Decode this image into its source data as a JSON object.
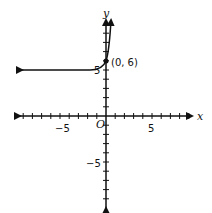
{
  "graph": {
    "x_axis_label": "x",
    "y_axis_label": "y",
    "origin_label": "O",
    "x_tick_labels": [
      {
        "value": -5,
        "text": "−5"
      },
      {
        "value": 5,
        "text": "5"
      }
    ],
    "y_tick_labels": [
      {
        "value": 5,
        "text": "5"
      },
      {
        "value": -5,
        "text": "−5"
      }
    ],
    "point": {
      "x": 0,
      "y": 6,
      "label": "(0, 6)"
    },
    "asymptote": 5,
    "x_range": [
      -9,
      9
    ],
    "y_range": [
      -9,
      10
    ]
  }
}
